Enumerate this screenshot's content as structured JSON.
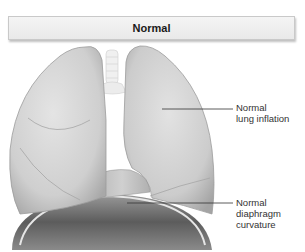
{
  "header": {
    "title": "Normal"
  },
  "labels": {
    "lung_inflation": "Normal\nlung inflation",
    "diaphragm": "Normal\ndiaphragm\ncurvature"
  },
  "colors": {
    "lung_fill": "#d6d6d6",
    "lung_shadow": "#9a9a9a",
    "diaphragm_fill": "#6e6e6e",
    "trachea_fill": "#eeeeee",
    "leader_line": "#333333"
  }
}
